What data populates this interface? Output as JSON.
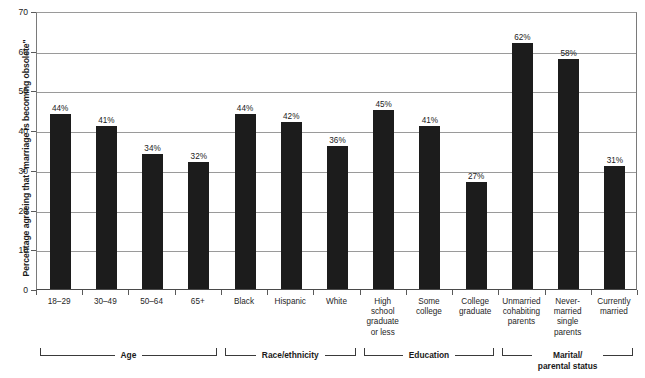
{
  "chart_data": {
    "type": "bar",
    "title": "",
    "xlabel": "",
    "ylabel": "Percentage agreeing that \"marriage is becoming obsolete\"",
    "ylim": [
      0,
      70
    ],
    "ytick_step": 10,
    "yticks": [
      "0",
      "10",
      "20",
      "30",
      "40",
      "50",
      "60",
      "70"
    ],
    "grid": true,
    "legend": "none",
    "bar_color": "#1c1c1c",
    "categories": [
      "18–29",
      "30–49",
      "50–64",
      "65+",
      "Black",
      "Hispanic",
      "White",
      "High school graduate or less",
      "Some college",
      "College graduate",
      "Unmarried cohabiting parents",
      "Never-married single parents",
      "Currently married"
    ],
    "values": [
      44,
      41,
      34,
      32,
      44,
      42,
      36,
      45,
      41,
      27,
      62,
      58,
      31
    ],
    "value_labels": [
      "44%",
      "41%",
      "34%",
      "32%",
      "44%",
      "42%",
      "36%",
      "45%",
      "41%",
      "27%",
      "62%",
      "58%",
      "31%"
    ],
    "category_label_lines": [
      [
        "18–29"
      ],
      [
        "30–49"
      ],
      [
        "50–64"
      ],
      [
        "65+"
      ],
      [
        "Black"
      ],
      [
        "Hispanic"
      ],
      [
        "White"
      ],
      [
        "High",
        "school",
        "graduate",
        "or less"
      ],
      [
        "Some",
        "college"
      ],
      [
        "College",
        "graduate"
      ],
      [
        "Unmarried",
        "cohabiting",
        "parents"
      ],
      [
        "Never-",
        "married",
        "single",
        "parents"
      ],
      [
        "Currently",
        "married"
      ]
    ],
    "groups": [
      {
        "label_lines": [
          "Age"
        ],
        "start": 0,
        "end": 3
      },
      {
        "label_lines": [
          "Race/ethnicity"
        ],
        "start": 4,
        "end": 6
      },
      {
        "label_lines": [
          "Education"
        ],
        "start": 7,
        "end": 9
      },
      {
        "label_lines": [
          "Marital/",
          "parental status"
        ],
        "start": 10,
        "end": 12
      }
    ]
  }
}
